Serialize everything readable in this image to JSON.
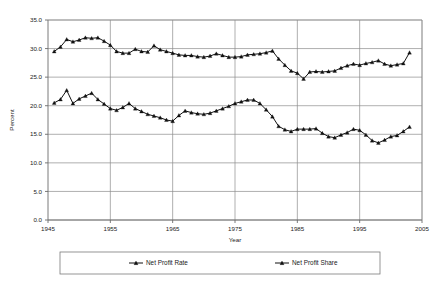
{
  "chart_data": {
    "type": "line",
    "title": "",
    "xlabel": "Year",
    "ylabel": "Percent",
    "xlim": [
      1945,
      2005
    ],
    "ylim": [
      0.0,
      35.0
    ],
    "xticks": [
      "1945",
      "1955",
      "1965",
      "1975",
      "1985",
      "1995",
      "2005"
    ],
    "xtick_values": [
      1945,
      1955,
      1965,
      1975,
      1985,
      1995,
      2005
    ],
    "yticks": [
      "0.0",
      "5.0",
      "10.0",
      "15.0",
      "20.0",
      "25.0",
      "30.0",
      "35.0"
    ],
    "ytick_values": [
      0.0,
      5.0,
      10.0,
      15.0,
      20.0,
      25.0,
      30.0,
      35.0
    ],
    "grid": true,
    "legend_position": "bottom",
    "x": [
      1946,
      1947,
      1948,
      1949,
      1950,
      1951,
      1952,
      1953,
      1954,
      1955,
      1956,
      1957,
      1958,
      1959,
      1960,
      1961,
      1962,
      1963,
      1964,
      1965,
      1966,
      1967,
      1968,
      1969,
      1970,
      1971,
      1972,
      1973,
      1974,
      1975,
      1976,
      1977,
      1978,
      1979,
      1980,
      1981,
      1982,
      1983,
      1984,
      1985,
      1986,
      1987,
      1988,
      1989,
      1990,
      1991,
      1992,
      1993,
      1994,
      1995,
      1996,
      1997,
      1998,
      1999,
      2000,
      2001,
      2002,
      2003
    ],
    "series": [
      {
        "name": "Net Profit Rate",
        "marker": "triangle",
        "values": [
          29.5,
          30.3,
          31.6,
          31.2,
          31.5,
          31.9,
          31.8,
          31.9,
          31.3,
          30.6,
          29.5,
          29.2,
          29.2,
          29.9,
          29.5,
          29.4,
          30.5,
          29.8,
          29.5,
          29.2,
          28.9,
          28.8,
          28.8,
          28.6,
          28.5,
          28.7,
          29.1,
          28.8,
          28.5,
          28.5,
          28.6,
          28.9,
          29.0,
          29.1,
          29.3,
          29.6,
          28.2,
          27.1,
          26.1,
          25.7,
          24.7,
          25.9,
          26.0,
          25.9,
          26.0,
          26.1,
          26.6,
          27.0,
          27.3,
          27.1,
          27.4,
          27.6,
          27.9,
          27.3,
          27.0,
          27.2,
          27.4,
          29.3
        ]
      },
      {
        "name": "Net Profit Share",
        "marker": "triangle",
        "values": [
          20.5,
          21.1,
          22.7,
          20.4,
          21.2,
          21.7,
          22.2,
          21.1,
          20.3,
          19.5,
          19.2,
          19.7,
          20.4,
          19.5,
          19.0,
          18.5,
          18.2,
          17.9,
          17.5,
          17.3,
          18.3,
          19.1,
          18.8,
          18.6,
          18.5,
          18.7,
          19.1,
          19.5,
          19.9,
          20.4,
          20.7,
          21.0,
          21.0,
          20.4,
          19.3,
          18.1,
          16.4,
          15.8,
          15.5,
          15.9,
          15.9,
          15.9,
          16.0,
          15.2,
          14.6,
          14.4,
          14.9,
          15.3,
          15.9,
          15.7,
          14.9,
          13.9,
          13.5,
          14.0,
          14.6,
          14.8,
          15.5,
          16.3
        ]
      }
    ]
  },
  "legend": {
    "items": [
      {
        "label": "Net Profit Rate"
      },
      {
        "label": "Net Profit Share"
      }
    ]
  },
  "axes": {
    "y_title": "Percent",
    "x_title": "Year"
  }
}
